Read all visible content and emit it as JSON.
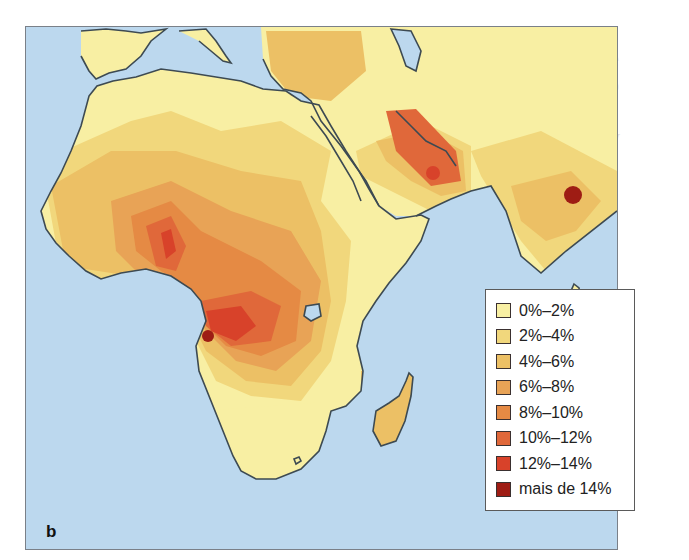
{
  "figure": {
    "panel_label": "b",
    "ocean_color": "#bcd8ee",
    "coast_color": "#3d4a52"
  },
  "legend": {
    "items": [
      {
        "label": "0%–2%",
        "color": "#f8efa3"
      },
      {
        "label": "2%–4%",
        "color": "#f1d77c"
      },
      {
        "label": "4%–6%",
        "color": "#ecc065"
      },
      {
        "label": "6%–8%",
        "color": "#e8a356"
      },
      {
        "label": "8%–10%",
        "color": "#e58a44"
      },
      {
        "label": "10%–12%",
        "color": "#e0683a"
      },
      {
        "label": "12%–14%",
        "color": "#d8422a"
      },
      {
        "label": "mais de 14%",
        "color": "#9e1c14"
      }
    ]
  },
  "background_text": [
    "O",
    "de",
    "ap",
    "os",
    "by",
    "fo",
    "us",
    "ol",
    "s",
    "o",
    "p"
  ]
}
